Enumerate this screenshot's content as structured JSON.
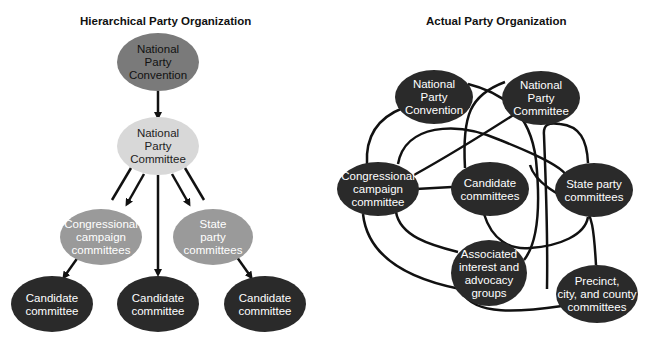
{
  "left_diagram": {
    "title": "Hierarchical Party Organization",
    "nodes": [
      {
        "id": "npc",
        "lines": [
          "National",
          "Party",
          "Convention"
        ],
        "cx": 158,
        "cy": 62,
        "rx": 41,
        "ry": 29,
        "fill": "#7a7a7a",
        "text_color": "#111111"
      },
      {
        "id": "npcom",
        "lines": [
          "National",
          "Party",
          "Committee"
        ],
        "cx": 158,
        "cy": 146,
        "rx": 41,
        "ry": 29,
        "fill": "#d8d8d8",
        "text_color": "#222222"
      },
      {
        "id": "ccc",
        "lines": [
          "Congressional",
          "campaign",
          "committees"
        ],
        "cx": 101,
        "cy": 237,
        "rx": 41,
        "ry": 28,
        "fill": "#9a9a9a",
        "text_color": "#ffffff"
      },
      {
        "id": "spc",
        "lines": [
          "State",
          "party",
          "committees"
        ],
        "cx": 213,
        "cy": 237,
        "rx": 40,
        "ry": 28,
        "fill": "#9a9a9a",
        "text_color": "#ffffff"
      },
      {
        "id": "cand1",
        "lines": [
          "Candidate",
          "committee"
        ],
        "cx": 52,
        "cy": 304,
        "rx": 41,
        "ry": 28,
        "fill": "#2a2a2a",
        "text_color": "#ffffff"
      },
      {
        "id": "cand2",
        "lines": [
          "Candidate",
          "committee"
        ],
        "cx": 158,
        "cy": 304,
        "rx": 41,
        "ry": 28,
        "fill": "#2a2a2a",
        "text_color": "#ffffff"
      },
      {
        "id": "cand3",
        "lines": [
          "Candidate",
          "committee"
        ],
        "cx": 265,
        "cy": 304,
        "rx": 41,
        "ry": 28,
        "fill": "#2a2a2a",
        "text_color": "#ffffff"
      }
    ],
    "arrows": [
      {
        "x1": 158,
        "y1": 91,
        "x2": 158,
        "y2": 117,
        "head": true
      },
      {
        "x1": 131,
        "y1": 168,
        "x2": 112,
        "y2": 200,
        "head": false
      },
      {
        "x1": 144,
        "y1": 174,
        "x2": 127,
        "y2": 204,
        "head": true
      },
      {
        "x1": 158,
        "y1": 175,
        "x2": 158,
        "y2": 274,
        "head": true
      },
      {
        "x1": 172,
        "y1": 174,
        "x2": 189,
        "y2": 204,
        "head": true
      },
      {
        "x1": 185,
        "y1": 168,
        "x2": 204,
        "y2": 200,
        "head": false
      },
      {
        "x1": 81,
        "y1": 253,
        "x2": 64,
        "y2": 277,
        "head": true
      },
      {
        "x1": 234,
        "y1": 253,
        "x2": 251,
        "y2": 277,
        "head": true
      }
    ]
  },
  "right_diagram": {
    "title": "Actual Party Organization",
    "node_fill": "#2a2a2a",
    "text_color": "#ffffff",
    "nodes": [
      {
        "id": "npc",
        "lines": [
          "National",
          "Party",
          "Convention"
        ],
        "cx": 434,
        "cy": 97,
        "rx": 39,
        "ry": 27
      },
      {
        "id": "npcom",
        "lines": [
          "National",
          "Party",
          "Committee"
        ],
        "cx": 541,
        "cy": 98,
        "rx": 39,
        "ry": 27
      },
      {
        "id": "ccc",
        "lines": [
          "Congressional",
          "campaign",
          "committee"
        ],
        "cx": 378,
        "cy": 189,
        "rx": 41,
        "ry": 27
      },
      {
        "id": "cand",
        "lines": [
          "Candidate",
          "committees"
        ],
        "cx": 490,
        "cy": 189,
        "rx": 39,
        "ry": 27
      },
      {
        "id": "spc",
        "lines": [
          "State party",
          "committees"
        ],
        "cx": 594,
        "cy": 190,
        "rx": 39,
        "ry": 27
      },
      {
        "id": "assoc",
        "lines": [
          "Associated",
          "interest and",
          "advocacy",
          "groups"
        ],
        "cx": 489,
        "cy": 273,
        "rx": 38,
        "ry": 33
      },
      {
        "id": "precinct",
        "lines": [
          "Precinct,",
          "city, and county",
          "committees"
        ],
        "cx": 597,
        "cy": 294,
        "rx": 41,
        "ry": 29
      }
    ],
    "links": [
      "M 367 164 C 365 130, 385 115, 403 108",
      "M 468 84 C 500 92, 530 110, 536 160 C 540 200, 540 240, 524 260",
      "M 398 164 C 405 125, 455 120, 500 140 C 530 152, 560 165, 566 175",
      "M 414 175 C 450 155, 490 130, 518 112",
      "M 505 82 C 470 95, 462 115, 465 168",
      "M 416 189 L 452 187",
      "M 547 289 C 548 230, 546 190, 544 135 C 543 125, 548 122, 560 124 C 580 126, 587 140, 588 163",
      "M 530 165 C 535 183, 558 195, 583 207 C 592 213, 594 230, 596 265",
      "M 484 214 C 492 240, 510 250, 530 248 C 560 246, 585 235, 588 217",
      "M 396 212 C 400 236, 430 245, 458 252",
      "M 363 214 C 368 260, 415 280, 460 289",
      "M 462 292 C 475 316, 520 312, 562 306"
    ]
  }
}
